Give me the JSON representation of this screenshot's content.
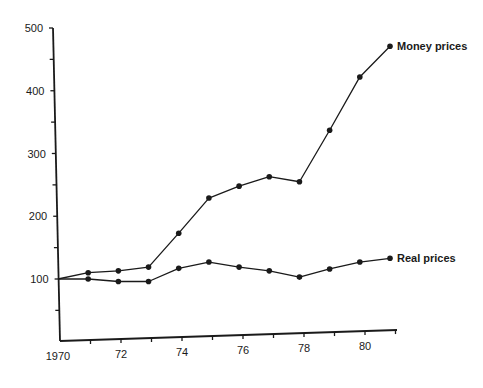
{
  "chart_data": {
    "type": "line",
    "title": "",
    "xlabel": "",
    "ylabel": "",
    "x": [
      1970,
      1971,
      1972,
      1973,
      1974,
      1975,
      1976,
      1977,
      1978,
      1979,
      1980,
      1981
    ],
    "x_tick_labels": [
      "1970",
      "72",
      "74",
      "76",
      "78",
      "80"
    ],
    "x_tick_values": [
      1970,
      1972,
      1974,
      1976,
      1978,
      1980
    ],
    "y_tick_labels": [
      "100",
      "200",
      "300",
      "400",
      "500"
    ],
    "y_tick_values": [
      100,
      200,
      300,
      400,
      500
    ],
    "ylim": [
      0,
      500
    ],
    "xlim": [
      1970,
      1981
    ],
    "grid": false,
    "legend_position": "inline-end-labels",
    "series": [
      {
        "name": "Money prices",
        "values": [
          100,
          110,
          113,
          119,
          173,
          229,
          248,
          263,
          255,
          337,
          422,
          471
        ]
      },
      {
        "name": "Real prices",
        "values": [
          100,
          100,
          96,
          96,
          117,
          127,
          119,
          113,
          103,
          116,
          127,
          133
        ]
      }
    ]
  }
}
